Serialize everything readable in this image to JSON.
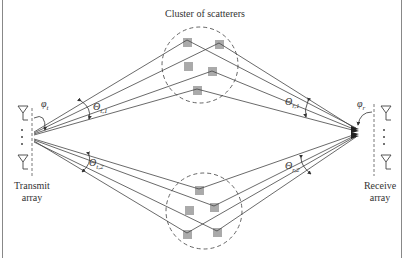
{
  "diagram": {
    "title": "Cluster of scatterers",
    "transmit_label_line1": "Transmit",
    "transmit_label_line2": "array",
    "receive_label_line1": "Receive",
    "receive_label_line2": "array",
    "angles": {
      "phi_t": {
        "symbol": "φ",
        "sub": "t"
      },
      "phi_r": {
        "symbol": "φ",
        "sub": "r"
      },
      "theta_t1": {
        "symbol": "Θ",
        "sub": "t,1"
      },
      "theta_r1": {
        "symbol": "Θ",
        "sub": "r,1"
      },
      "theta_t2": {
        "symbol": "Θ",
        "sub": "t,2"
      },
      "theta_r2": {
        "symbol": "Θ",
        "sub": "r,2"
      }
    },
    "array_dots": "·\n·\n·",
    "colors": {
      "line": "#444444",
      "scatterer": "#aaaaaa",
      "cluster_outline": "#555555",
      "border": "#888888"
    }
  }
}
